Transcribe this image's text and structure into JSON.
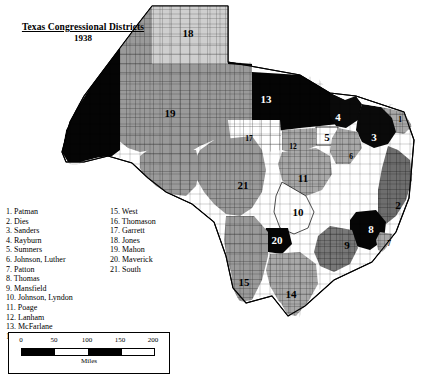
{
  "title": {
    "line1": "Texas Congressional Districts",
    "line2": "1938"
  },
  "legend": {
    "left_column": [
      "1. Patman",
      "2. Dies",
      "3. Sanders",
      "4. Rayburn",
      "5. Sumners",
      "6. Johnson, Luther",
      "7. Patton",
      "8. Thomas",
      "9. Mansfield",
      "10. Johnson, Lyndon",
      "11. Poage",
      "12. Lanham",
      "13. McFarlane",
      "14. Kleberg"
    ],
    "right_column": [
      "15. West",
      "16. Thomason",
      "17. Garrett",
      "18. Jones",
      "19. Mahon",
      "20. Maverick",
      "21. South"
    ]
  },
  "scale": {
    "ticks": [
      "0",
      "50",
      "100",
      "150",
      "200"
    ],
    "unit_label": "Miles"
  },
  "map": {
    "district_labels": [
      {
        "id": "18",
        "text": "18",
        "x": 188,
        "y": 33,
        "color": "black",
        "size": "big"
      },
      {
        "id": "19",
        "text": "19",
        "x": 170,
        "y": 113,
        "color": "black",
        "size": "big"
      },
      {
        "id": "13",
        "text": "13",
        "x": 266,
        "y": 99,
        "color": "white",
        "size": "big"
      },
      {
        "id": "4",
        "text": "4",
        "x": 338,
        "y": 117,
        "color": "white",
        "size": "big"
      },
      {
        "id": "3",
        "text": "3",
        "x": 374,
        "y": 137,
        "color": "white",
        "size": "big"
      },
      {
        "id": "5",
        "text": "5",
        "x": 327,
        "y": 137,
        "color": "black",
        "size": "big"
      },
      {
        "id": "1",
        "text": "1",
        "x": 400,
        "y": 120,
        "color": "black",
        "size": "small"
      },
      {
        "id": "6",
        "text": "6",
        "x": 351,
        "y": 157,
        "color": "black",
        "size": "small"
      },
      {
        "id": "17",
        "text": "17",
        "x": 249,
        "y": 139,
        "color": "black",
        "size": "small"
      },
      {
        "id": "16",
        "text": "16",
        "x": 108,
        "y": 186,
        "color": "white",
        "size": "big"
      },
      {
        "id": "21",
        "text": "21",
        "x": 243,
        "y": 185,
        "color": "black",
        "size": "big"
      },
      {
        "id": "11",
        "text": "11",
        "x": 303,
        "y": 178,
        "color": "black",
        "size": "big"
      },
      {
        "id": "12",
        "text": "12",
        "x": 293,
        "y": 147,
        "color": "black",
        "size": "small"
      },
      {
        "id": "2",
        "text": "2",
        "x": 398,
        "y": 205,
        "color": "black",
        "size": "big"
      },
      {
        "id": "10",
        "text": "10",
        "x": 298,
        "y": 212,
        "color": "black",
        "size": "big"
      },
      {
        "id": "8",
        "text": "8",
        "x": 371,
        "y": 229,
        "color": "white",
        "size": "big"
      },
      {
        "id": "9",
        "text": "9",
        "x": 347,
        "y": 245,
        "color": "black",
        "size": "big"
      },
      {
        "id": "7",
        "text": "7",
        "x": 389,
        "y": 244,
        "color": "black",
        "size": "small"
      },
      {
        "id": "20",
        "text": "20",
        "x": 277,
        "y": 240,
        "color": "white",
        "size": "big"
      },
      {
        "id": "15",
        "text": "15",
        "x": 244,
        "y": 282,
        "color": "black",
        "size": "big"
      },
      {
        "id": "14",
        "text": "14",
        "x": 291,
        "y": 294,
        "color": "black",
        "size": "big"
      }
    ]
  }
}
